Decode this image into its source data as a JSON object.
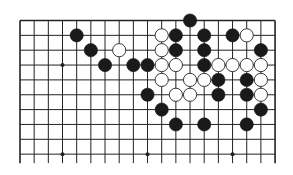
{
  "diagram": {
    "type": "go-board-partial",
    "columns": 19,
    "rows_shown": 10,
    "top_edge": true,
    "left_edge": true,
    "right_edge": true,
    "bottom_edge": false,
    "star_points": [
      {
        "col": 3,
        "row": 3
      },
      {
        "col": 3,
        "row": 9
      },
      {
        "col": 9,
        "row": 9
      },
      {
        "col": 15,
        "row": 9
      }
    ],
    "stones": [
      {
        "color": "black",
        "col": 4,
        "row": 1
      },
      {
        "color": "black",
        "col": 5,
        "row": 2
      },
      {
        "color": "white",
        "col": 7,
        "row": 2
      },
      {
        "color": "black",
        "col": 6,
        "row": 3
      },
      {
        "color": "black",
        "col": 8,
        "row": 3
      },
      {
        "color": "black",
        "col": 9,
        "row": 3
      },
      {
        "color": "black",
        "col": 12,
        "row": 0
      },
      {
        "color": "white",
        "col": 10,
        "row": 1
      },
      {
        "color": "black",
        "col": 11,
        "row": 1
      },
      {
        "color": "black",
        "col": 13,
        "row": 1
      },
      {
        "color": "black",
        "col": 15,
        "row": 1
      },
      {
        "color": "white",
        "col": 16,
        "row": 1
      },
      {
        "color": "white",
        "col": 10,
        "row": 2
      },
      {
        "color": "black",
        "col": 11,
        "row": 2
      },
      {
        "color": "black",
        "col": 13,
        "row": 2
      },
      {
        "color": "black",
        "col": 17,
        "row": 2
      },
      {
        "color": "white",
        "col": 10,
        "row": 3
      },
      {
        "color": "white",
        "col": 11,
        "row": 3
      },
      {
        "color": "black",
        "col": 13,
        "row": 3
      },
      {
        "color": "white",
        "col": 14,
        "row": 3
      },
      {
        "color": "white",
        "col": 15,
        "row": 3
      },
      {
        "color": "white",
        "col": 16,
        "row": 3
      },
      {
        "color": "white",
        "col": 17,
        "row": 3
      },
      {
        "color": "white",
        "col": 10,
        "row": 4
      },
      {
        "color": "white",
        "col": 12,
        "row": 4
      },
      {
        "color": "white",
        "col": 13,
        "row": 4
      },
      {
        "color": "black",
        "col": 14,
        "row": 4
      },
      {
        "color": "black",
        "col": 16,
        "row": 4
      },
      {
        "color": "white",
        "col": 17,
        "row": 4
      },
      {
        "color": "black",
        "col": 9,
        "row": 5
      },
      {
        "color": "white",
        "col": 11,
        "row": 5
      },
      {
        "color": "white",
        "col": 12,
        "row": 5
      },
      {
        "color": "black",
        "col": 14,
        "row": 5
      },
      {
        "color": "black",
        "col": 16,
        "row": 5
      },
      {
        "color": "white",
        "col": 17,
        "row": 5
      },
      {
        "color": "black",
        "col": 10,
        "row": 6
      },
      {
        "color": "black",
        "col": 17,
        "row": 6
      },
      {
        "color": "black",
        "col": 11,
        "row": 7
      },
      {
        "color": "black",
        "col": 13,
        "row": 7
      },
      {
        "color": "black",
        "col": 16,
        "row": 7
      }
    ],
    "colors": {
      "line": "#222222",
      "black_stone": "#1a1a1a",
      "white_stone": "#ffffff",
      "background": "#ffffff"
    }
  }
}
